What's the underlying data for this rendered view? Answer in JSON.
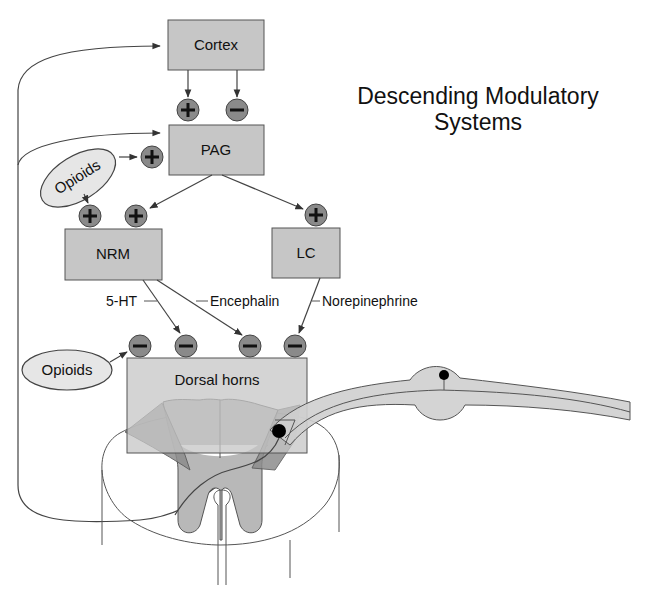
{
  "title": {
    "line1": "Descending Modulatory",
    "line2": "Systems"
  },
  "nodes": {
    "cortex": "Cortex",
    "pag": "PAG",
    "nrm": "NRM",
    "lc": "LC",
    "dorsal_horns": "Dorsal horns"
  },
  "modulators": {
    "opioids_upper": "Opioids",
    "opioids_lower": "Opioids"
  },
  "neurotransmitters": {
    "serotonin": "5-HT",
    "encephalin": "Encephalin",
    "norepinephrine": "Norepinephrine"
  },
  "signs": {
    "plus": "+",
    "minus": "−"
  },
  "connections": [
    {
      "from": "Cortex",
      "to": "PAG",
      "effect": "+"
    },
    {
      "from": "Cortex",
      "to": "PAG",
      "effect": "−"
    },
    {
      "from": "Opioids",
      "to": "PAG",
      "effect": "+"
    },
    {
      "from": "Opioids",
      "to": "NRM",
      "effect": "+"
    },
    {
      "from": "PAG",
      "to": "NRM",
      "effect": "+"
    },
    {
      "from": "PAG",
      "to": "LC",
      "effect": "+"
    },
    {
      "from": "Opioids",
      "to": "Dorsal horns",
      "effect": "−"
    },
    {
      "from": "NRM",
      "to": "Dorsal horns",
      "via": "5-HT",
      "effect": "−"
    },
    {
      "from": "NRM",
      "to": "Dorsal horns",
      "via": "Encephalin",
      "effect": "−"
    },
    {
      "from": "LC",
      "to": "Dorsal horns",
      "via": "Norepinephrine",
      "effect": "−"
    },
    {
      "from": "Spinal cord",
      "to": "Cortex",
      "effect": "ascending"
    },
    {
      "from": "Spinal cord",
      "to": "PAG",
      "effect": "ascending"
    }
  ],
  "colors": {
    "box_fill": "#c6c6c6",
    "sign_fill": "#8a8a8a",
    "ellipse_fill": "#e6e6e6",
    "grey_matter": "#b8b8b8",
    "dorsal_horn_dark": "#8c8c8c"
  }
}
